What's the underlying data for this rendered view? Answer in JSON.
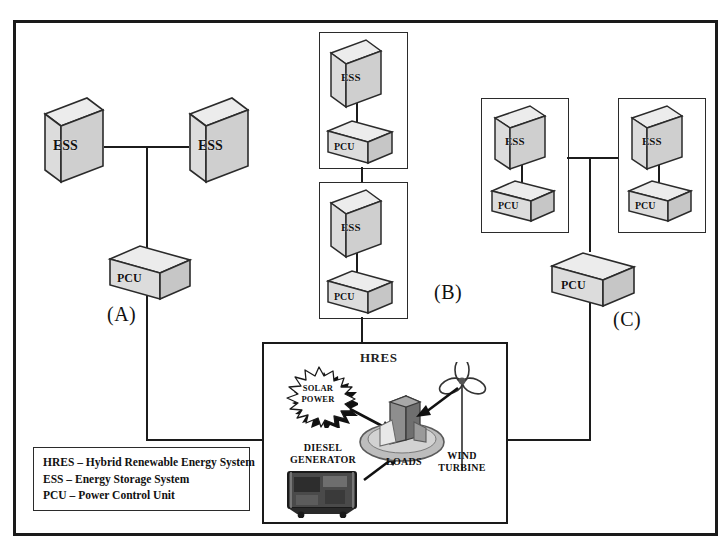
{
  "diagram": {
    "groups": [
      {
        "id": "A",
        "label": "(A)",
        "nodes": [
          {
            "type": "ESS",
            "label": "ESS"
          },
          {
            "type": "ESS",
            "label": "ESS"
          },
          {
            "type": "PCU",
            "label": "PCU"
          }
        ]
      },
      {
        "id": "B",
        "label": "(B)",
        "nodes": [
          {
            "type": "ESS",
            "label": "ESS"
          },
          {
            "type": "PCU",
            "label": "PCU"
          },
          {
            "type": "ESS",
            "label": "ESS"
          },
          {
            "type": "PCU",
            "label": "PCU"
          }
        ]
      },
      {
        "id": "C",
        "label": "(C)",
        "nodes": [
          {
            "type": "ESS",
            "label": "ESS"
          },
          {
            "type": "PCU",
            "label": "PCU"
          },
          {
            "type": "ESS",
            "label": "ESS"
          },
          {
            "type": "PCU",
            "label": "PCU"
          },
          {
            "type": "PCU",
            "label": "PCU"
          }
        ]
      }
    ],
    "hres": {
      "title": "HRES",
      "sources": [
        {
          "name": "solar-power",
          "label": "SOLAR POWER",
          "line1": "SOLAR",
          "line2": "POWER"
        },
        {
          "name": "diesel-generator",
          "label": "DIESEL GENERATOR",
          "line1": "DIESEL",
          "line2": "GENERATOR"
        },
        {
          "name": "wind-turbine",
          "label": "WIND TURBINE",
          "line1": "WIND",
          "line2": "TURBINE"
        }
      ],
      "sink": {
        "name": "loads",
        "label": "LOADS"
      }
    },
    "legend": {
      "lines": [
        "HRES – Hybrid Renewable Energy System",
        "ESS – Energy Storage System",
        "PCU – Power Control Unit"
      ]
    },
    "colors": {
      "line": "#1c1c1c",
      "block_front": "#d8d8d8",
      "block_side": "#a9a9a9",
      "block_top": "#ececec",
      "background": "#ffffff"
    }
  }
}
